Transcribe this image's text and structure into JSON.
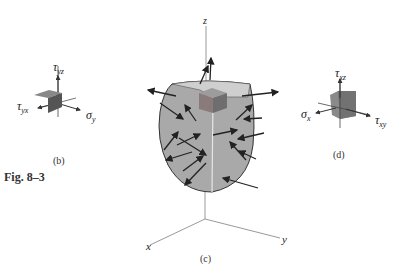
{
  "figure": {
    "number_label": "Fig. 8–3",
    "panels": {
      "b": {
        "caption": "(b)",
        "labels": {
          "tau_yz": {
            "symbol": "τ",
            "sub": "yz"
          },
          "tau_yx": {
            "symbol": "τ",
            "sub": "yx"
          },
          "sigma_y": {
            "symbol": "σ",
            "sub": "y"
          }
        }
      },
      "c": {
        "caption": "(c)",
        "axes": {
          "z": "z",
          "x": "x",
          "y": "y"
        }
      },
      "d": {
        "caption": "(d)",
        "labels": {
          "tau_xz": {
            "symbol": "τ",
            "sub": "xz"
          },
          "sigma_x": {
            "symbol": "σ",
            "sub": "x"
          },
          "tau_xy": {
            "symbol": "τ",
            "sub": "xy"
          }
        }
      }
    },
    "colors": {
      "body_fill": "#a9a9a9",
      "body_top": "#cdcdcd",
      "cube_front": "#8a8a8a",
      "cube_side": "#6e6e6e",
      "cube_top": "#9e9e9e",
      "arrow": "#222222",
      "axis": "#8a8a8a"
    }
  }
}
